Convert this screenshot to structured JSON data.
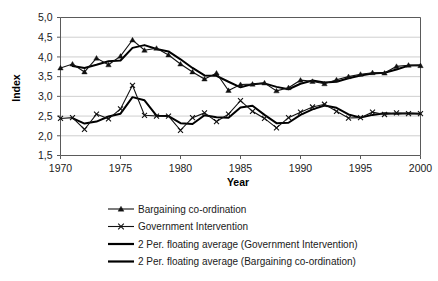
{
  "chart_data": {
    "type": "line",
    "title": "",
    "xlabel": "Year",
    "ylabel": "Index",
    "xlim": [
      1970,
      2000
    ],
    "ylim": [
      1.5,
      5.0
    ],
    "grid": true,
    "legend_position": "bottom",
    "decimal_separator": ",",
    "x_ticks": [
      "1970",
      "1975",
      "1980",
      "1985",
      "1990",
      "1995",
      "2000"
    ],
    "x_tick_values": [
      1970,
      1975,
      1980,
      1985,
      1990,
      1995,
      2000
    ],
    "y_ticks": [
      "1,5",
      "2,0",
      "2,5",
      "3,0",
      "3,5",
      "4,0",
      "4,5",
      "5,0"
    ],
    "y_tick_values": [
      1.5,
      2.0,
      2.5,
      3.0,
      3.5,
      4.0,
      4.5,
      5.0
    ],
    "x": [
      1970,
      1971,
      1972,
      1973,
      1974,
      1975,
      1976,
      1977,
      1978,
      1979,
      1980,
      1981,
      1982,
      1983,
      1984,
      1985,
      1986,
      1987,
      1988,
      1989,
      1990,
      1991,
      1992,
      1993,
      1994,
      1995,
      1996,
      1997,
      1998,
      1999,
      2000
    ],
    "series": [
      {
        "name": "Bargaining co-ordination",
        "marker": "triangle",
        "values": [
          3.72,
          3.82,
          3.62,
          3.97,
          3.8,
          4.02,
          4.43,
          4.17,
          4.22,
          4.05,
          3.82,
          3.62,
          3.44,
          3.59,
          3.15,
          3.3,
          3.31,
          3.34,
          3.14,
          3.22,
          3.41,
          3.38,
          3.32,
          3.42,
          3.5,
          3.56,
          3.6,
          3.59,
          3.76,
          3.79,
          3.78
        ]
      },
      {
        "name": "Government Intervention",
        "marker": "x",
        "values": [
          2.44,
          2.46,
          2.16,
          2.55,
          2.43,
          2.68,
          3.28,
          2.52,
          2.5,
          2.5,
          2.14,
          2.46,
          2.58,
          2.36,
          2.55,
          2.89,
          2.62,
          2.44,
          2.2,
          2.46,
          2.6,
          2.73,
          2.8,
          2.62,
          2.45,
          2.46,
          2.6,
          2.54,
          2.58,
          2.56,
          2.56
        ]
      },
      {
        "name": "2 Per. floating average (Government Intervention)",
        "marker": "none",
        "values": [
          null,
          2.45,
          2.31,
          2.36,
          2.49,
          2.56,
          2.98,
          2.9,
          2.51,
          2.5,
          2.32,
          2.3,
          2.52,
          2.47,
          2.46,
          2.72,
          2.76,
          2.53,
          2.32,
          2.33,
          2.53,
          2.67,
          2.77,
          2.71,
          2.54,
          2.46,
          2.53,
          2.57,
          2.56,
          2.57,
          2.56
        ]
      },
      {
        "name": "2 Per. floating average (Bargaining co-ordination)",
        "marker": "none",
        "values": [
          null,
          3.77,
          3.72,
          3.8,
          3.89,
          3.91,
          4.23,
          4.3,
          4.2,
          4.14,
          3.94,
          3.72,
          3.53,
          3.52,
          3.37,
          3.23,
          3.31,
          3.33,
          3.24,
          3.18,
          3.32,
          3.4,
          3.35,
          3.37,
          3.46,
          3.53,
          3.58,
          3.6,
          3.68,
          3.78,
          3.79
        ]
      }
    ],
    "legend": [
      {
        "label": "Bargaining co-ordination",
        "marker": "triangle",
        "style": "thin"
      },
      {
        "label": "Government Intervention",
        "marker": "x",
        "style": "thin"
      },
      {
        "label": "2 Per. floating average (Government Intervention)",
        "marker": "none",
        "style": "thick"
      },
      {
        "label": "2 Per. floating average (Bargaining co-ordination)",
        "marker": "none",
        "style": "thick"
      }
    ],
    "colors": {
      "line": "#111111",
      "grid": "#b9b9b9",
      "axis": "#5a5a5a",
      "background": "#ffffff"
    }
  }
}
